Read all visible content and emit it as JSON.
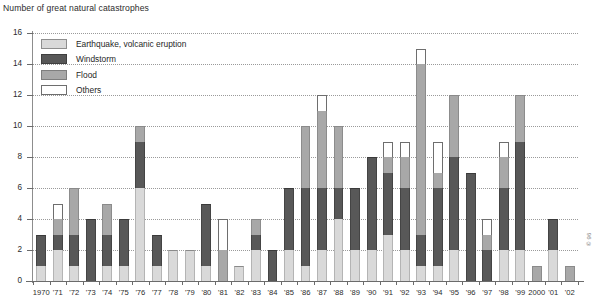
{
  "chart_data": {
    "type": "bar",
    "stacked": true,
    "title": "Number of great natural catastrophes",
    "xlabel": "",
    "ylabel": "",
    "ylim": [
      0,
      16
    ],
    "ytick_step": 2,
    "yticks": [
      0,
      2,
      4,
      6,
      8,
      10,
      12,
      14,
      16
    ],
    "grid": true,
    "grid_style": "dotted-horizontal",
    "legend_position": "top-left-inside",
    "categories": [
      "1970",
      "'71",
      "'72",
      "'73",
      "'74",
      "'75",
      "'76",
      "'77",
      "'78",
      "'79",
      "'80",
      "'81",
      "'82",
      "'83",
      "'84",
      "'85",
      "'86",
      "'87",
      "'88",
      "'89",
      "'90",
      "'91",
      "'92",
      "'93",
      "'94",
      "'95",
      "'96",
      "'97",
      "'98",
      "'99",
      "2000",
      "'01",
      "'02"
    ],
    "years": [
      1970,
      1971,
      1972,
      1973,
      1974,
      1975,
      1976,
      1977,
      1978,
      1979,
      1980,
      1981,
      1982,
      1983,
      1984,
      1985,
      1986,
      1987,
      1988,
      1989,
      1990,
      1991,
      1992,
      1993,
      1994,
      1995,
      1996,
      1997,
      1998,
      1999,
      2000,
      2001,
      2002
    ],
    "series": [
      {
        "name": "Earthquake, volcanic eruption",
        "color": "#d9d9d9",
        "values": [
          1,
          2,
          1,
          0,
          1,
          1,
          6,
          1,
          2,
          2,
          1,
          0,
          1,
          2,
          0,
          2,
          1,
          2,
          4,
          2,
          2,
          3,
          2,
          1,
          1,
          2,
          0,
          0,
          2,
          2,
          0,
          2,
          0
        ]
      },
      {
        "name": "Windstorm",
        "color": "#585858",
        "values": [
          2,
          1,
          2,
          4,
          2,
          3,
          3,
          2,
          0,
          0,
          4,
          0,
          0,
          1,
          2,
          4,
          5,
          4,
          2,
          4,
          6,
          4,
          4,
          2,
          5,
          6,
          7,
          2,
          4,
          7,
          0,
          2,
          0
        ]
      },
      {
        "name": "Flood",
        "color": "#a8a8a8",
        "values": [
          0,
          1,
          3,
          0,
          2,
          0,
          1,
          0,
          0,
          0,
          0,
          2,
          0,
          1,
          0,
          0,
          4,
          5,
          4,
          0,
          0,
          1,
          2,
          11,
          1,
          4,
          0,
          1,
          2,
          3,
          1,
          0,
          1
        ]
      },
      {
        "name": "Others",
        "color": "#ffffff",
        "values": [
          0,
          1,
          0,
          0,
          0,
          0,
          0,
          0,
          0,
          0,
          0,
          2,
          0,
          0,
          0,
          0,
          0,
          1,
          0,
          0,
          0,
          1,
          1,
          1,
          2,
          0,
          0,
          1,
          1,
          0,
          0,
          0,
          0
        ]
      }
    ],
    "totals": [
      3,
      5,
      6,
      4,
      5,
      4,
      10,
      3,
      2,
      2,
      5,
      4,
      1,
      4,
      2,
      6,
      10,
      12,
      10,
      6,
      8,
      9,
      9,
      15,
      9,
      12,
      7,
      4,
      9,
      12,
      1,
      4,
      1
    ],
    "source_note": "© 96"
  },
  "legend": {
    "items": [
      {
        "label": "Earthquake, volcanic eruption",
        "swatch": "eq"
      },
      {
        "label": "Windstorm",
        "swatch": "wind"
      },
      {
        "label": "Flood",
        "swatch": "flood"
      },
      {
        "label": "Others",
        "swatch": "other"
      }
    ]
  }
}
